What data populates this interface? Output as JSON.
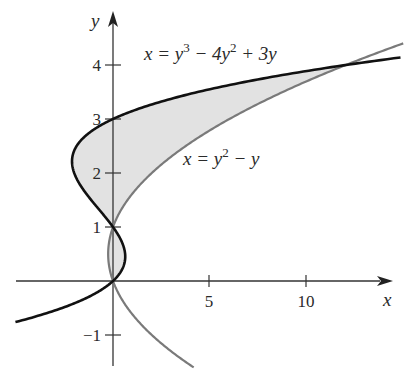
{
  "chart_data": {
    "type": "line",
    "title": "",
    "xlabel": "x",
    "ylabel": "y",
    "xlim": [
      -5,
      15
    ],
    "ylim": [
      -1.7,
      4.7
    ],
    "grid": false,
    "x_ticks": [
      5,
      10
    ],
    "x_tick_labels": [
      "5",
      "10"
    ],
    "y_ticks": [
      -1,
      1,
      2,
      3,
      4
    ],
    "y_tick_labels": [
      "−1",
      "1",
      "2",
      "3",
      "4"
    ],
    "series": [
      {
        "name": "x = y^3 - 4y^2 + 3y",
        "label_text": "x = y³ − 4y² + 3y",
        "color": "#111111",
        "param": "y",
        "y_range": [
          -0.76,
          4.14
        ],
        "points_xy": [
          [
            -5.0,
            -0.76
          ],
          [
            -2.0,
            -0.4
          ],
          [
            0,
            0
          ],
          [
            0.63,
            0.45
          ],
          [
            0,
            1
          ],
          [
            -1.4,
            1.6
          ],
          [
            -2.11,
            2.2
          ],
          [
            -1.6,
            2.6
          ],
          [
            0,
            3
          ],
          [
            3.5,
            3.5
          ],
          [
            12,
            4
          ],
          [
            14.3,
            4.14
          ]
        ]
      },
      {
        "name": "x = y^2 - y",
        "label_text": "x = y² − y",
        "color": "#777777",
        "param": "y",
        "y_range": [
          -1.6,
          4.4
        ],
        "points_xy": [
          [
            4.16,
            -1.6
          ],
          [
            2,
            -1
          ],
          [
            0.75,
            -0.5
          ],
          [
            0,
            0
          ],
          [
            -0.25,
            0.5
          ],
          [
            0,
            1
          ],
          [
            2,
            2
          ],
          [
            6,
            3
          ],
          [
            12,
            4
          ],
          [
            14.96,
            4.4
          ]
        ]
      }
    ],
    "intersections": [
      [
        0,
        0
      ],
      [
        0,
        1
      ],
      [
        12,
        4
      ]
    ],
    "shaded_region": {
      "description": "region bounded between the two curves for 0 ≤ y ≤ 4",
      "color": "#e4e4e4"
    },
    "annotations": [
      {
        "text": "x = y³ − 4y² + 3y",
        "near": [
          1.5,
          4.2
        ]
      },
      {
        "text": "x = y² − y",
        "near": [
          4,
          2.3
        ]
      }
    ]
  },
  "labels": {
    "x_axis": "x",
    "y_axis": "y",
    "tick_x5": "5",
    "tick_x10": "10",
    "tick_y4": "4",
    "tick_y3": "3",
    "tick_y2": "2",
    "tick_y1": "1",
    "tick_ym1": "−1",
    "cubic_eq_lhs": "x = y",
    "cubic_eq_exp1": "3",
    "cubic_eq_mid": " − 4y",
    "cubic_eq_exp2": "2",
    "cubic_eq_end": " + 3y",
    "parab_eq_lhs": "x = y",
    "parab_eq_exp": "2",
    "parab_eq_end": " − y"
  },
  "colors": {
    "cubic": "#111111",
    "parabola": "#7a7a7a",
    "fill": "#e2e2e2",
    "axis": "#333333"
  }
}
